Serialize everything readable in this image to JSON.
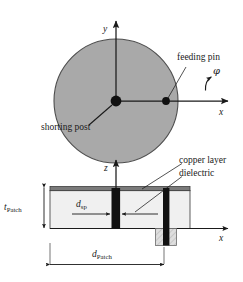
{
  "figure": {
    "kind": "antenna-geometry-diagram",
    "colors": {
      "patch_fill": "#a9a9a9",
      "patch_stroke": "#4d4d4d",
      "line": "#1a1a1a",
      "copper": "#6e6e6e",
      "dielectric": "#f0f0f0",
      "post_fill": "#111111",
      "connector_fill": "#d8d8d8",
      "background": "#ffffff"
    }
  },
  "top_view": {
    "axes": {
      "y_label": "y",
      "x_label": "x",
      "phi_label": "φ"
    },
    "annotations": {
      "feeding_pin": "feeding pin",
      "shorting_post": "shorting post"
    }
  },
  "side_view": {
    "axes": {
      "z_label": "z",
      "x_label": "x"
    },
    "annotations": {
      "copper_layer": "copper layer",
      "dielectric": "dielectric"
    },
    "dimensions": {
      "thickness": {
        "symbol": "t",
        "subscript": "Patch"
      },
      "pin_offset": {
        "symbol": "d",
        "subscript": "sp"
      },
      "diameter": {
        "symbol": "d",
        "subscript": "Patch"
      }
    }
  }
}
